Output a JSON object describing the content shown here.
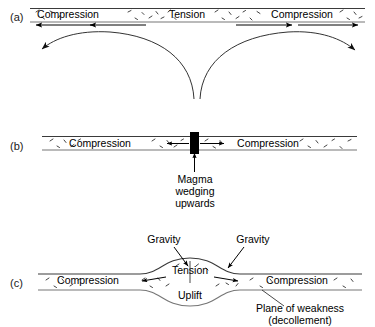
{
  "figure": {
    "background_color": "#ffffff",
    "line_color": "#222222",
    "dike_color": "#000000"
  },
  "panels": [
    {
      "id": "a",
      "label": "(a)",
      "description": "Flat crustal layer with compression at both ends and tension in the centre, above two diverging convection flow curves.",
      "band_labels": [
        {
          "text": "Compression",
          "x": 68,
          "y": 18,
          "stress": "compression"
        },
        {
          "text": "Tension",
          "x": 187,
          "y": 18,
          "stress": "tension"
        },
        {
          "text": "Compression",
          "x": 302,
          "y": 18,
          "stress": "compression"
        }
      ],
      "arrows": [
        {
          "direction": "left",
          "x1": 92,
          "x2": 34,
          "y": 25
        },
        {
          "direction": "left",
          "x1": 146,
          "x2": 88,
          "y": 25
        },
        {
          "direction": "right",
          "x1": 236,
          "x2": 294,
          "y": 25
        },
        {
          "direction": "right",
          "x1": 296,
          "x2": 360,
          "y": 25
        }
      ],
      "flow_curves": [
        {
          "name": "left-convection-curve",
          "arrow_at": "bottom-left"
        },
        {
          "name": "right-convection-curve",
          "arrow_at": "bottom-right"
        }
      ]
    },
    {
      "id": "b",
      "label": "(b)",
      "description": "Flat crustal layer split in the centre by a black magma dike, compression on both sides, arrows pushing outward from the dike.",
      "band_labels": [
        {
          "text": "Compression",
          "x": 100,
          "y": 146,
          "stress": "compression"
        },
        {
          "text": "Compression",
          "x": 268,
          "y": 146,
          "stress": "compression"
        }
      ],
      "arrows": [
        {
          "direction": "left",
          "x1": 190,
          "x2": 166,
          "y": 146
        },
        {
          "direction": "right",
          "x1": 201,
          "x2": 226,
          "y": 146
        }
      ],
      "dike": {
        "name": "magma-dike",
        "x": 190,
        "width": 9
      },
      "annotation": {
        "name": "magma-annotation",
        "lines": [
          "Magma",
          "wedging",
          "upwards"
        ],
        "x": 195,
        "y": 180
      }
    },
    {
      "id": "c",
      "label": "(c)",
      "description": "Upwarped crustal layer; gravity acts down the flanks, tension over the crest above an uplift, compression on both distal ends, riding on a plane of weakness (decollement).",
      "band_labels": [
        {
          "text": "Compression",
          "x": 88,
          "y": 283,
          "stress": "compression"
        },
        {
          "text": "Tension",
          "x": 189,
          "y": 272,
          "stress": "tension"
        },
        {
          "text": "Compression",
          "x": 296,
          "y": 283,
          "stress": "compression"
        }
      ],
      "arrows": [
        {
          "direction": "left",
          "x1": 166,
          "x2": 140,
          "y": 278
        },
        {
          "direction": "right",
          "x1": 214,
          "x2": 240,
          "y": 278
        }
      ],
      "annotations": [
        {
          "name": "gravity-left",
          "text": "Gravity",
          "x": 164,
          "y": 241
        },
        {
          "name": "gravity-right",
          "text": "Gravity",
          "x": 253,
          "y": 241
        },
        {
          "name": "uplift",
          "text": "Uplift",
          "x": 189,
          "y": 293
        },
        {
          "name": "plane-of-weakness",
          "lines": [
            "Plane of weakness",
            "(decollement)"
          ],
          "x": 300,
          "y": 305
        }
      ]
    }
  ]
}
